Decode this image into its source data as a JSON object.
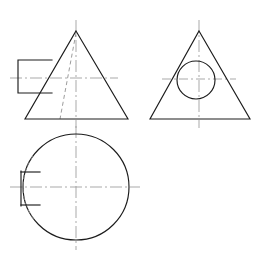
{
  "sheet": {
    "title": "Orthographic Projection - Cone with Keyway",
    "background_color": "#ffffff",
    "width": 261,
    "height": 258,
    "line_colors": {
      "visible_edge": "#1c1c1c",
      "hidden_edge": "#8a8a8a",
      "center_line": "#9a9a9a"
    }
  },
  "views": [
    {
      "id": "front-view",
      "label": "Front View",
      "geometry": {
        "type": "triangle",
        "apex": [
          76,
          31
        ],
        "base_left": [
          25,
          119
        ],
        "base_right": [
          128,
          119
        ],
        "base_y": 119,
        "base_width": 103,
        "height": 88
      },
      "features": [
        {
          "id": "front-keyway-rect",
          "label": "Keyway Boss",
          "type": "rectangle",
          "x": 18,
          "y": 60,
          "width": 34,
          "height": 33,
          "edges_visible": [
            "top",
            "left",
            "bottom"
          ]
        },
        {
          "id": "front-keyway-hidden",
          "label": "Hidden Slant Edge",
          "type": "hidden-line",
          "from": [
            76,
            31
          ],
          "to": [
            60,
            119
          ]
        }
      ],
      "center_lines": [
        {
          "id": "front-vertical-center",
          "orientation": "vertical",
          "x": 76,
          "y1": 20,
          "y2": 128
        },
        {
          "id": "front-horizontal-center",
          "orientation": "horizontal",
          "y": 78,
          "x1": 10,
          "x2": 118
        }
      ]
    },
    {
      "id": "side-view",
      "label": "Right Side View",
      "geometry": {
        "type": "triangle",
        "apex": [
          199,
          31
        ],
        "base_left": [
          150,
          119
        ],
        "base_right": [
          250,
          119
        ],
        "base_y": 119,
        "base_width": 100,
        "height": 88
      },
      "features": [
        {
          "id": "side-circle",
          "label": "Bore Circle",
          "type": "circle",
          "cx": 196,
          "cy": 80,
          "r": 19
        }
      ],
      "center_lines": [
        {
          "id": "side-vertical-center",
          "orientation": "vertical",
          "x": 199,
          "y1": 20,
          "y2": 128
        },
        {
          "id": "side-horizontal-center",
          "orientation": "horizontal",
          "y": 79,
          "x1": 162,
          "x2": 236
        }
      ]
    },
    {
      "id": "top-view",
      "label": "Top View",
      "geometry": {
        "type": "circle",
        "cx": 76,
        "cy": 187,
        "r": 53
      },
      "features": [
        {
          "id": "top-keyway-slot",
          "label": "Keyway Slot",
          "type": "slot",
          "left_x": 21,
          "right_x": 40,
          "top_y": 172,
          "bottom_y": 205
        },
        {
          "id": "top-keyway-hidden-arc",
          "label": "Hidden Arc Behind Slot",
          "type": "hidden-arc"
        }
      ],
      "center_lines": [
        {
          "id": "top-vertical-center",
          "orientation": "vertical",
          "x": 76,
          "y1": 126,
          "y2": 250
        },
        {
          "id": "top-horizontal-center",
          "orientation": "horizontal",
          "y": 187,
          "x1": 10,
          "x2": 140
        }
      ]
    }
  ]
}
